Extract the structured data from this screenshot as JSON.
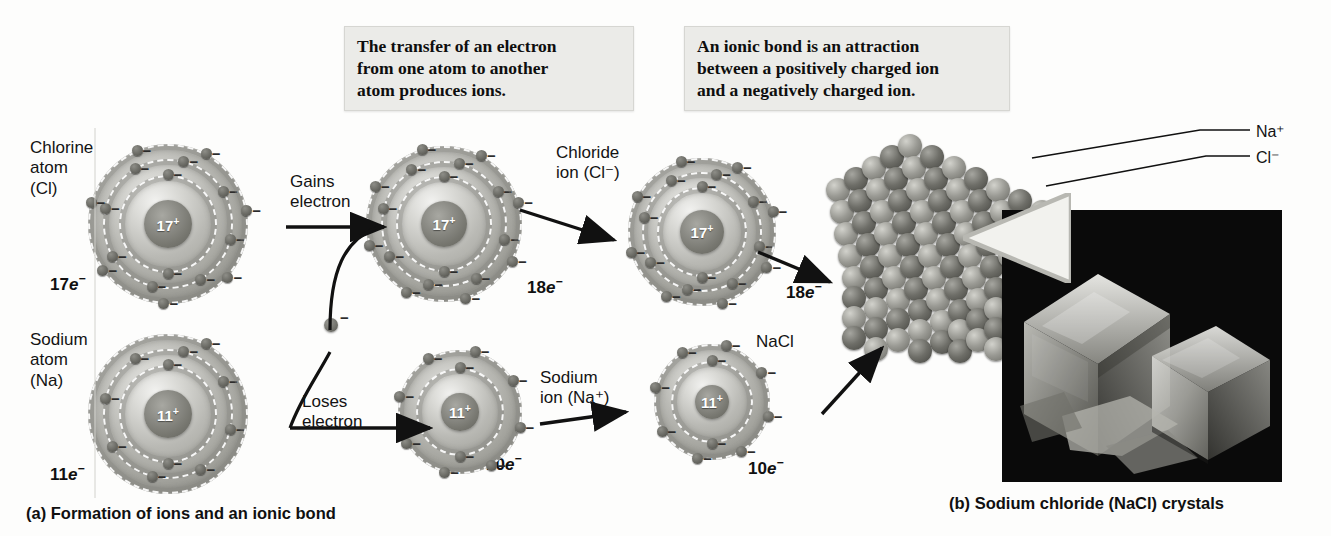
{
  "figure": {
    "panel_a_caption": "(a) Formation of ions and an ionic bond",
    "panel_b_caption": "(b) Sodium chloride (NaCl) crystals"
  },
  "callouts": {
    "transfer": "The transfer of an electron\nfrom one atom to another\natom produces ions.",
    "ionic_bond": "An ionic bond is an attraction\nbetween a positively charged ion\nand a negatively charged ion."
  },
  "labels": {
    "chlorine_atom": "Chlorine\natom\n(Cl)",
    "sodium_atom": "Sodium\natom\n(Na)",
    "chloride_ion": "Chloride\nion (Cl⁻)",
    "sodium_ion": "Sodium\nion (Na⁺)",
    "nacl": "NaCl",
    "gains_electron": "Gains\nelectron",
    "loses_electron": "Loses\nelectron",
    "na_plus": "Na⁺",
    "cl_minus": "Cl⁻"
  },
  "electron_counts": {
    "chlorine_atom": "17",
    "sodium_atom": "11",
    "chloride_ion_mid": "18",
    "sodium_ion_mid": "10",
    "chloride_ion_right": "18",
    "sodium_ion_right": "10",
    "suffix": "e",
    "sign": "−"
  },
  "nuclei": {
    "chlorine_atom": "17",
    "sodium_atom": "11",
    "chloride_ion_mid": "17",
    "sodium_ion_mid": "11",
    "chloride_ion_right": "17",
    "sodium_ion_right": "11",
    "positive": "+"
  },
  "colors": {
    "background": "#fdfdfc",
    "callout_bg": "#ebebe8",
    "text": "#131313",
    "shell_gray": "#a4a49e",
    "nucleus_gray": "#76766f",
    "electron_dark": "#4d4d48",
    "photo_bg": "#070707",
    "lattice_light": "#9a9a94",
    "lattice_dark": "#6e6e68"
  }
}
